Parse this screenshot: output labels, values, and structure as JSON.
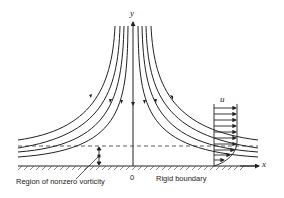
{
  "diagram": {
    "type": "stagnation-point flow near a rigid boundary",
    "labels": {
      "y_axis": "y",
      "x_axis": "x",
      "origin": "0",
      "velocity": "u",
      "region": "Region of nonzero vorticity",
      "boundary": "Rigid boundary"
    },
    "colors": {
      "line": "#222222",
      "background": "#ffffff"
    }
  }
}
